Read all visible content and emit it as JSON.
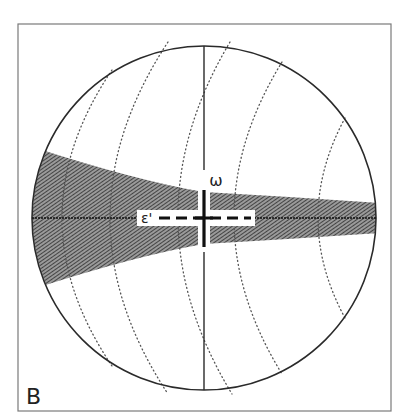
{
  "panel": {
    "label": "B"
  },
  "labels": {
    "omega": "ω",
    "epsilon_prime": "ε'"
  },
  "geometry": {
    "frame": {
      "x": 18,
      "y": 24,
      "width": 373,
      "height": 387
    },
    "circle": {
      "cx": 204,
      "cy": 218,
      "r": 172
    },
    "band": {
      "left_half_width": 73,
      "center_half_width": 26,
      "right_half_width": 15
    },
    "epsilon_box": {
      "x": 137,
      "y": 210,
      "width": 118,
      "height": 16
    },
    "omega_pos": {
      "x": 216,
      "y": 186
    },
    "b_label_pos": {
      "x": 26,
      "y": 404
    }
  },
  "colors": {
    "line": "#2a2a2a",
    "frame": "#7a7a7a",
    "hatch": "#3a3a3a",
    "dots": "#555555",
    "background": "#ffffff"
  },
  "dotted_arcs": [
    {
      "top": [
        112,
        70
      ],
      "mid": [
        62,
        218
      ],
      "bottom": [
        112,
        366
      ]
    },
    {
      "top": [
        168,
        42
      ],
      "mid": [
        110,
        218
      ],
      "bottom": [
        168,
        394
      ]
    },
    {
      "top": [
        230,
        42
      ],
      "mid": [
        178,
        218
      ],
      "bottom": [
        232,
        394
      ]
    },
    {
      "top": [
        282,
        62
      ],
      "mid": [
        234,
        218
      ],
      "bottom": [
        282,
        374
      ]
    },
    {
      "top": [
        345,
        118
      ],
      "mid": [
        318,
        218
      ],
      "bottom": [
        345,
        318
      ]
    }
  ]
}
